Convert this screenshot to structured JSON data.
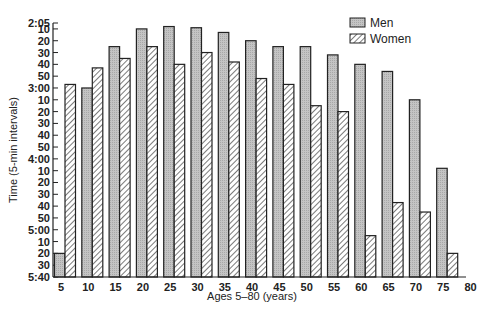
{
  "chart_data": {
    "type": "bar",
    "title": "",
    "xlabel": "Ages 5–80 (years)",
    "ylabel": "Time (5-min intervals)",
    "y_unit": "minutes (axis inverted: faster times at top)",
    "ylim_minutes": [
      125,
      340
    ],
    "y_inverted": true,
    "y_ticks": [
      {
        "label": "2:05",
        "minutes": 125
      },
      {
        "label": "10",
        "minutes": 130
      },
      {
        "label": "20",
        "minutes": 140
      },
      {
        "label": "30",
        "minutes": 150
      },
      {
        "label": "40",
        "minutes": 160
      },
      {
        "label": "50",
        "minutes": 170
      },
      {
        "label": "3:00",
        "minutes": 180
      },
      {
        "label": "10",
        "minutes": 190
      },
      {
        "label": "20",
        "minutes": 200
      },
      {
        "label": "30",
        "minutes": 210
      },
      {
        "label": "40",
        "minutes": 220
      },
      {
        "label": "50",
        "minutes": 230
      },
      {
        "label": "4:00",
        "minutes": 240
      },
      {
        "label": "10",
        "minutes": 250
      },
      {
        "label": "20",
        "minutes": 260
      },
      {
        "label": "30",
        "minutes": 270
      },
      {
        "label": "40",
        "minutes": 280
      },
      {
        "label": "50",
        "minutes": 290
      },
      {
        "label": "5:00",
        "minutes": 300
      },
      {
        "label": "10",
        "minutes": 310
      },
      {
        "label": "20",
        "minutes": 320
      },
      {
        "label": "30",
        "minutes": 330
      },
      {
        "label": "5:40",
        "minutes": 340
      }
    ],
    "categories": [
      "5",
      "10",
      "15",
      "20",
      "25",
      "30",
      "35",
      "40",
      "45",
      "50",
      "55",
      "60",
      "65",
      "70",
      "75"
    ],
    "x_tick_labels": [
      "5",
      "10",
      "15",
      "20",
      "25",
      "30",
      "35",
      "40",
      "45",
      "50",
      "55",
      "60",
      "65",
      "70",
      "75",
      "80"
    ],
    "series": [
      {
        "name": "Men",
        "pattern": "stipple-gray",
        "values": [
          320,
          180,
          145,
          130,
          128,
          129,
          133,
          140,
          145,
          145,
          152,
          160,
          166,
          190,
          248
        ]
      },
      {
        "name": "Women",
        "pattern": "diagonal-hatch",
        "values": [
          177,
          163,
          155,
          145,
          160,
          150,
          158,
          172,
          177,
          195,
          200,
          305,
          277,
          285,
          320
        ]
      }
    ],
    "legend": {
      "position": "top-right",
      "entries": [
        "Men",
        "Women"
      ]
    },
    "grid": false
  },
  "colors": {
    "men_fill": "#bdbdbd",
    "bar_stroke": "#222222",
    "hatch": "#333333",
    "axis": "#222222"
  }
}
